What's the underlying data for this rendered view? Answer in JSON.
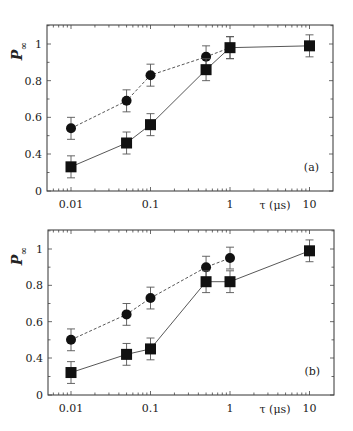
{
  "chart_data": [
    {
      "type": "line",
      "panel_label": "(a)",
      "xlabel": "τ (μs)",
      "ylabel": "P∞",
      "xscale": "log",
      "x_ticks": [
        "0.01",
        "0.1",
        "1",
        "10"
      ],
      "y_ticks": [
        "0",
        "0.4",
        "0.6",
        "0.8",
        "1"
      ],
      "ylim": [
        0,
        1.1
      ],
      "series": [
        {
          "name": "circles (dashed)",
          "marker": "circle",
          "line": "dashed",
          "x": [
            0.01,
            0.05,
            0.1,
            0.5,
            1
          ],
          "values": [
            0.54,
            0.69,
            0.83,
            0.93,
            0.98
          ],
          "err": [
            0.06,
            0.06,
            0.06,
            0.06,
            0.06
          ]
        },
        {
          "name": "squares (solid)",
          "marker": "square",
          "line": "solid",
          "x": [
            0.01,
            0.05,
            0.1,
            0.5,
            1,
            10
          ],
          "values": [
            0.33,
            0.46,
            0.56,
            0.86,
            0.98,
            0.99
          ],
          "err": [
            0.06,
            0.06,
            0.06,
            0.06,
            0.06,
            0.06
          ]
        }
      ]
    },
    {
      "type": "line",
      "panel_label": "(b)",
      "xlabel": "τ (μs)",
      "ylabel": "P∞",
      "xscale": "log",
      "x_ticks": [
        "0.01",
        "0.1",
        "1",
        "10"
      ],
      "y_ticks": [
        "0",
        "0.4",
        "0.6",
        "0.8",
        "1"
      ],
      "ylim": [
        0,
        1.1
      ],
      "series": [
        {
          "name": "circles (dashed)",
          "marker": "circle",
          "line": "dashed",
          "x": [
            0.01,
            0.05,
            0.1,
            0.5,
            1
          ],
          "values": [
            0.5,
            0.64,
            0.73,
            0.9,
            0.95
          ],
          "err": [
            0.06,
            0.06,
            0.06,
            0.06,
            0.06
          ]
        },
        {
          "name": "squares (solid)",
          "marker": "square",
          "line": "solid",
          "x": [
            0.01,
            0.05,
            0.1,
            0.5,
            1,
            10
          ],
          "values": [
            0.32,
            0.42,
            0.45,
            0.82,
            0.82,
            0.99
          ],
          "err": [
            0.06,
            0.06,
            0.06,
            0.06,
            0.06,
            0.06
          ]
        }
      ]
    }
  ]
}
